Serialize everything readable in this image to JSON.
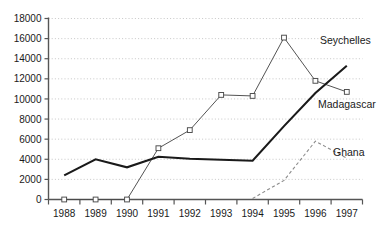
{
  "chart_data": {
    "type": "line",
    "title": "",
    "xlabel": "",
    "ylabel": "",
    "categories": [
      "1988",
      "1989",
      "1990",
      "1991",
      "1992",
      "1993",
      "1994",
      "1995",
      "1996",
      "1997"
    ],
    "x": [
      1988,
      1989,
      1990,
      1991,
      1992,
      1993,
      1994,
      1995,
      1996,
      1997
    ],
    "ylim": [
      0,
      18000
    ],
    "ytick_values": [
      0,
      2000,
      4000,
      6000,
      8000,
      10000,
      12000,
      14000,
      16000,
      18000
    ],
    "ytick_labels": [
      "0",
      "2000",
      "4000",
      "6000",
      "8000",
      "10000",
      "12000",
      "14000",
      "16000",
      "18000"
    ],
    "grid": true,
    "grid_style": "dotted",
    "legend_position": "inline-right-annotations",
    "series": [
      {
        "name": "Seychelles",
        "style": "thin-line-with-square-markers",
        "color": "#4a4a4a",
        "marker": "open-square",
        "values": [
          0,
          0,
          0,
          5100,
          6900,
          10400,
          10300,
          16100,
          11800,
          10700
        ]
      },
      {
        "name": "Madagascar",
        "style": "thick-line",
        "color": "#1a1a1a",
        "marker": "none",
        "values": [
          2400,
          4000,
          3200,
          4250,
          4050,
          3950,
          3850,
          7300,
          10600,
          13300
        ]
      },
      {
        "name": "Ghana",
        "style": "dashed-line",
        "color": "#8c8c8c",
        "marker": "none",
        "values": [
          null,
          null,
          null,
          null,
          null,
          null,
          100,
          1900,
          5800,
          4100
        ]
      }
    ],
    "annotations": [
      {
        "text": "Seychelles",
        "series": "Seychelles"
      },
      {
        "text": "Madagascar",
        "series": "Madagascar"
      },
      {
        "text": "Ghana",
        "series": "Ghana"
      }
    ]
  }
}
